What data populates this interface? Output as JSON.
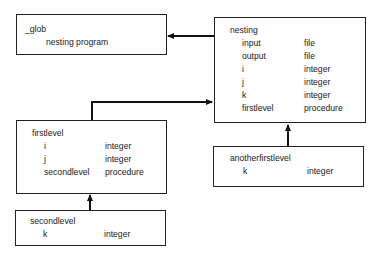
{
  "diagram": {
    "boxes": {
      "glob": {
        "title": "_glob",
        "subtitle": "nesting program"
      },
      "nesting": {
        "title": "nesting",
        "entries": [
          {
            "name": "input",
            "type": "file"
          },
          {
            "name": "output",
            "type": "file"
          },
          {
            "name": "i",
            "type": "integer"
          },
          {
            "name": "j",
            "type": "integer"
          },
          {
            "name": "k",
            "type": "integer"
          },
          {
            "name": "firstlevel",
            "type": "procedure"
          }
        ]
      },
      "firstlevel": {
        "title": "firstlevel",
        "entries": [
          {
            "name": "i",
            "type": "integer"
          },
          {
            "name": "j",
            "type": "integer"
          },
          {
            "name": "secondlevel",
            "type": "procedure"
          }
        ]
      },
      "secondlevel": {
        "title": "secondlevel",
        "entries": [
          {
            "name": "k",
            "type": "integer"
          }
        ]
      },
      "anotherfirstlevel": {
        "title": "anotherfirstlevel",
        "entries": [
          {
            "name": "k",
            "type": "integer"
          }
        ]
      }
    },
    "edges": [
      {
        "from": "nesting",
        "to": "glob"
      },
      {
        "from": "firstlevel",
        "to": "nesting"
      },
      {
        "from": "anotherfirstlevel",
        "to": "nesting"
      },
      {
        "from": "secondlevel",
        "to": "firstlevel"
      }
    ],
    "colors": {
      "line": "#111111",
      "text": "#1a1a1a",
      "background": "#ffffff"
    }
  }
}
